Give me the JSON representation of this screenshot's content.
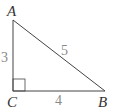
{
  "diagram": {
    "type": "right-triangle",
    "colors": {
      "line": "#444444",
      "vertex_label": "#333333",
      "side_label": "#8a8a8a"
    },
    "vertices": [
      {
        "name": "A",
        "x": 13,
        "y": 20
      },
      {
        "name": "B",
        "x": 105,
        "y": 91
      },
      {
        "name": "C",
        "x": 13,
        "y": 91
      }
    ],
    "right_angle_at": "C",
    "sides": {
      "AC": "3",
      "CB": "4",
      "AB": "5"
    },
    "labels": {
      "A": "A",
      "B": "B",
      "C": "C"
    }
  }
}
